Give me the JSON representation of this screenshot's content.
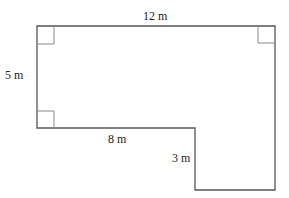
{
  "diagram": {
    "type": "composite rectilinear shape (L-shape)",
    "labels": {
      "top": "12 m",
      "left": "5 m",
      "inner_bottom": "8 m",
      "inner_vertical": "3 m"
    },
    "right_angle_markers": [
      "top-left",
      "top-right",
      "bottom-left"
    ],
    "stroke_color": "#555555"
  }
}
